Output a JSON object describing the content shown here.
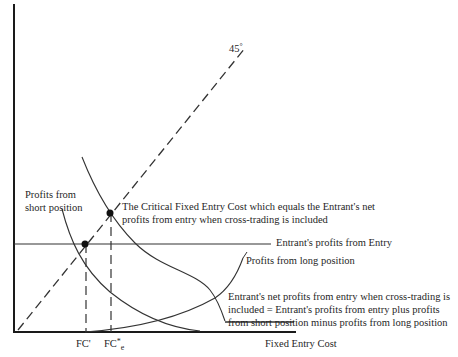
{
  "diagram": {
    "angle_label": "45",
    "angle_unit": "°",
    "x_axis_label": "Fixed Entry Cost",
    "tick_fc_prime": "FC'",
    "tick_fc_e_base": "FC",
    "tick_fc_e_sup": "*",
    "tick_fc_e_sub": "e",
    "label_short_position_line1": "Profits from",
    "label_short_position_line2": "short position",
    "label_critical_line1": "The Critical Fixed Entry Cost which equals the Entrant's net",
    "label_critical_line2": "profits from entry when cross-trading is included",
    "label_entrant_profits": "Entrant's profits from Entry",
    "label_long_position": "Profits from long position",
    "label_net_line1": "Entrant's net profits from entry when cross-trading is",
    "label_net_line2": "included = Entrant's profits from entry plus profits",
    "label_net_line3": "from short position minus profits from long position"
  }
}
